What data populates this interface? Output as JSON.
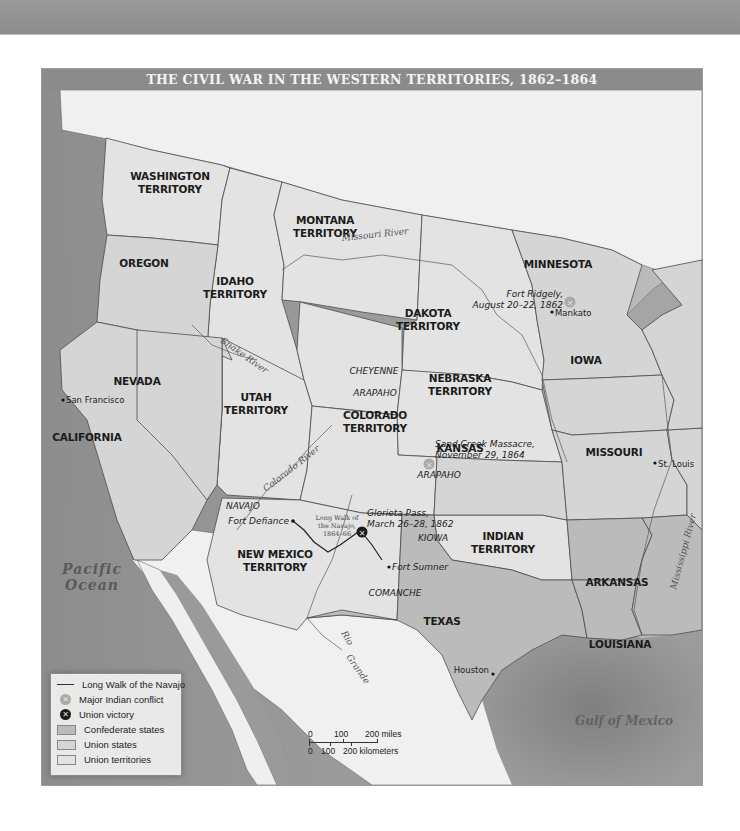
{
  "title": "THE CIVIL WAR IN THE WESTERN TERRITORIES, 1862–1864",
  "colors": {
    "confederate": "#b9b9b9",
    "union_states": "#d6d6d6",
    "union_territories": "#e2e2e2",
    "foreign_land": "#f1f1f1",
    "water": "#8f8f8f",
    "title_bar": "#8b8b8b",
    "border": "#555555"
  },
  "regions": {
    "washington": [
      "WASHINGTON",
      "TERRITORY"
    ],
    "oregon": [
      "OREGON"
    ],
    "idaho": [
      "IDAHO",
      "TERRITORY"
    ],
    "montana": [
      "MONTANA",
      "TERRITORY"
    ],
    "dakota": [
      "DAKOTA",
      "TERRITORY"
    ],
    "minnesota": [
      "MINNESOTA"
    ],
    "nevada": [
      "NEVADA"
    ],
    "utah": [
      "UTAH",
      "TERRITORY"
    ],
    "nebraska": [
      "NEBRASKA",
      "TERRITORY"
    ],
    "iowa": [
      "IOWA"
    ],
    "california": [
      "CALIFORNIA"
    ],
    "colorado": [
      "COLORADO",
      "TERRITORY"
    ],
    "kansas": [
      "KANSAS"
    ],
    "missouri": [
      "MISSOURI"
    ],
    "new_mexico": [
      "NEW MEXICO",
      "TERRITORY"
    ],
    "indian": [
      "INDIAN",
      "TERRITORY"
    ],
    "arkansas": [
      "ARKANSAS"
    ],
    "texas": [
      "TEXAS"
    ],
    "louisiana": [
      "LOUISIANA"
    ]
  },
  "tribes": {
    "cheyenne": "CHEYENNE",
    "arapaho_north": "ARAPAHO",
    "arapaho_south": "ARAPAHO",
    "navajo": "NAVAJO",
    "kiowa": "KIOWA",
    "comanche": "COMANCHE"
  },
  "rivers": {
    "missouri": "Missouri River",
    "snake": "Snake River",
    "colorado": "Colorado River",
    "rio_grande_1": "Rio",
    "rio_grande_2": "Grande",
    "mississippi": "Mississippi River"
  },
  "water_bodies": {
    "pacific_1": "Pacific",
    "pacific_2": "Ocean",
    "gulf": "Gulf of Mexico"
  },
  "cities": {
    "san_francisco": "San Francisco",
    "mankato": "Mankato",
    "st_louis": "St. Louis",
    "houston": "Houston",
    "fort_defiance": "Fort Defiance",
    "fort_sumner": "Fort Sumner"
  },
  "events": {
    "fort_ridgely": [
      "Fort Ridgely,",
      "August 20–22, 1862"
    ],
    "sand_creek": [
      "Sand Creek Massacre,",
      "November 29, 1864"
    ],
    "glorieta": [
      "Glorieta Pass,",
      "March 26–28, 1862"
    ],
    "long_walk": [
      "Long Walk of",
      "the Navajo,",
      "1864–66"
    ]
  },
  "legend": {
    "items": [
      {
        "label": "Long Walk of the Navajo",
        "type": "line"
      },
      {
        "label": "Major Indian conflict",
        "type": "gray-dot"
      },
      {
        "label": "Union victory",
        "type": "black-dot"
      },
      {
        "label": "Confederate states",
        "type": "box-confederate"
      },
      {
        "label": "Union states",
        "type": "box-union-states"
      },
      {
        "label": "Union territories",
        "type": "box-union-territories"
      }
    ]
  },
  "scale": {
    "miles_ticks": [
      "0",
      "100",
      "200 miles"
    ],
    "km_ticks": [
      "0",
      "100",
      "200 kilometers"
    ]
  },
  "icons": {
    "conflict_glyph": "✕",
    "victory_glyph": "✕"
  }
}
